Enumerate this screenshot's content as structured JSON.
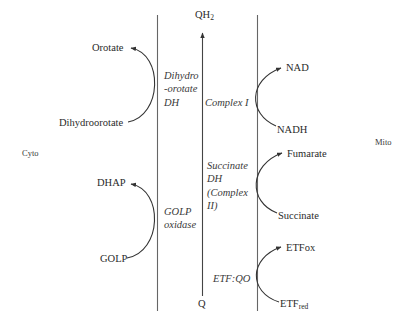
{
  "compartments": {
    "left": "Cyto",
    "right": "Mito"
  },
  "quinone_pool": {
    "top": {
      "base": "QH",
      "sub": "2"
    },
    "bottom": "Q"
  },
  "enzymes": {
    "dhodh": [
      "Dihydro",
      "-orotate",
      "DH"
    ],
    "golp_oxidase": [
      "GOLP",
      "oxidase"
    ],
    "complex_i": "Complex I",
    "sdh": [
      "Succinate",
      "DH",
      "(Complex",
      "II)"
    ],
    "etfqo": "ETF:QO"
  },
  "reactions": {
    "dhodh": {
      "substrate": "Dihydroorotate",
      "product": "Orotate",
      "side": "cyto"
    },
    "golp": {
      "substrate": "GOLP",
      "product": "DHAP",
      "side": "cyto"
    },
    "complex_i": {
      "substrate": "NADH",
      "product": "NAD",
      "side": "mito"
    },
    "sdh": {
      "substrate": "Succinate",
      "product": "Fumarate",
      "side": "mito"
    },
    "etfqo": {
      "substrate": {
        "base": "ETF",
        "sub": "red"
      },
      "product": "ETFox",
      "side": "mito"
    }
  },
  "colors": {
    "line": "#555555",
    "text": "#2a2a2a"
  }
}
